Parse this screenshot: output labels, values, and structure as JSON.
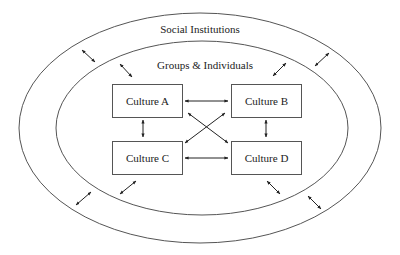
{
  "diagram": {
    "outer_ring": {
      "label": "Social Institutions",
      "cx": 200,
      "cy": 128,
      "rx": 181,
      "ry": 115
    },
    "inner_ring": {
      "label": "Groups & Individuals",
      "cx": 202,
      "cy": 128,
      "rx": 146,
      "ry": 87
    },
    "boxes": [
      {
        "id": "A",
        "label": "Culture A",
        "x": 112,
        "y": 84
      },
      {
        "id": "B",
        "label": "Culture B",
        "x": 231,
        "y": 84
      },
      {
        "id": "C",
        "label": "Culture C",
        "x": 112,
        "y": 141
      },
      {
        "id": "D",
        "label": "Culture D",
        "x": 231,
        "y": 141
      }
    ],
    "connections": [
      {
        "from": "A",
        "to": "B",
        "type": "bidirectional"
      },
      {
        "from": "C",
        "to": "D",
        "type": "bidirectional"
      },
      {
        "from": "A",
        "to": "C",
        "type": "bidirectional"
      },
      {
        "from": "B",
        "to": "D",
        "type": "bidirectional"
      },
      {
        "from": "A",
        "to": "D",
        "type": "bidirectional"
      },
      {
        "from": "B",
        "to": "C",
        "type": "bidirectional"
      }
    ],
    "ring_interactions": [
      {
        "position": "outer-top-left",
        "type": "bidirectional"
      },
      {
        "position": "inner-top-left",
        "type": "bidirectional"
      },
      {
        "position": "inner-top-right",
        "type": "bidirectional"
      },
      {
        "position": "outer-top-right",
        "type": "bidirectional"
      },
      {
        "position": "inner-bottom-left",
        "type": "bidirectional"
      },
      {
        "position": "outer-bottom-left",
        "type": "bidirectional"
      },
      {
        "position": "inner-bottom-right",
        "type": "bidirectional"
      },
      {
        "position": "outer-bottom-right",
        "type": "bidirectional"
      }
    ],
    "colors": {
      "line": "#555555",
      "arrow": "#222222",
      "text": "#222222",
      "background": "#ffffff"
    }
  }
}
